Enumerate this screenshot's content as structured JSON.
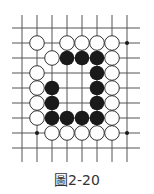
{
  "caption": "圖2-20",
  "board": {
    "cols": 8,
    "rows": 9,
    "origin_x": 22,
    "origin_y": 28,
    "spacing": 15,
    "line_left": 12,
    "line_right": 140,
    "line_top": 15,
    "line_bottom": 162,
    "stone_radius": 7.3,
    "colors": {
      "line": "#555555",
      "black": "#1a1a1a",
      "white_fill": "#ffffff",
      "white_stroke": "#333333"
    },
    "star_points": [
      [
        7,
        1
      ],
      [
        1,
        7
      ],
      [
        7,
        7
      ]
    ],
    "white_stones": [
      [
        1,
        1
      ],
      [
        3,
        1
      ],
      [
        4,
        1
      ],
      [
        5,
        1
      ],
      [
        6,
        1
      ],
      [
        2,
        2
      ],
      [
        6,
        2
      ],
      [
        1,
        3
      ],
      [
        6,
        3
      ],
      [
        1,
        4
      ],
      [
        6,
        4
      ],
      [
        1,
        5
      ],
      [
        6,
        5
      ],
      [
        1,
        6
      ],
      [
        6,
        6
      ],
      [
        2,
        7
      ],
      [
        3,
        7
      ],
      [
        4,
        7
      ],
      [
        5,
        7
      ],
      [
        6,
        7
      ]
    ],
    "black_stones": [
      [
        3,
        2
      ],
      [
        4,
        2
      ],
      [
        5,
        2
      ],
      [
        5,
        3
      ],
      [
        2,
        4
      ],
      [
        5,
        4
      ],
      [
        2,
        5
      ],
      [
        5,
        5
      ],
      [
        2,
        6
      ],
      [
        3,
        6
      ],
      [
        4,
        6
      ],
      [
        5,
        6
      ]
    ]
  }
}
